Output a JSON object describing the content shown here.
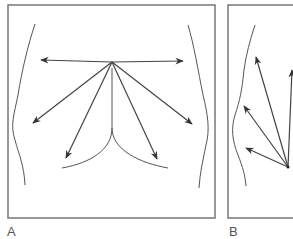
{
  "panels": [
    {
      "id": "A",
      "label": "A",
      "view": "frontal torso",
      "arrow_count": 6
    },
    {
      "id": "B",
      "label": "B",
      "view": "lateral torso",
      "arrow_count": 4
    }
  ],
  "colors": {
    "frame": "#777777",
    "line": "#444444",
    "label": "#555555"
  }
}
